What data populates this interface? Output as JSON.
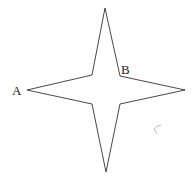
{
  "figure": {
    "shape": "four-pointed star",
    "labels": {
      "a": "A",
      "b": "B"
    },
    "stroke_color": "#333333",
    "mark": "small curved pencil stroke"
  }
}
